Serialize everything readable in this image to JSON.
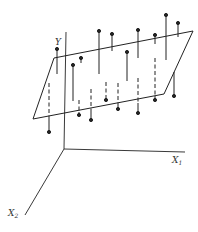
{
  "diagram": {
    "title": "",
    "stroke_color": "#222222",
    "axes": {
      "y_label": "Y",
      "x1_label": "X",
      "x1_sub": "1",
      "x2_label": "X",
      "x2_sub": "2",
      "origin": [
        64,
        149
      ],
      "y_end": [
        66,
        32
      ],
      "x1_end": [
        185,
        152
      ],
      "x2_end": [
        25,
        215
      ]
    },
    "plane": {
      "corners": [
        [
          54,
          58
        ],
        [
          193,
          31
        ],
        [
          164,
          94
        ],
        [
          33,
          119
        ]
      ]
    },
    "points_above": [
      {
        "x": 57,
        "top": 49,
        "bottom": 74
      },
      {
        "x": 81,
        "top": 58,
        "bottom": 63
      },
      {
        "x": 73,
        "top": 65,
        "bottom": 101
      },
      {
        "x": 99,
        "top": 31,
        "bottom": 74
      },
      {
        "x": 112,
        "top": 34,
        "bottom": 51
      },
      {
        "x": 127,
        "top": 52,
        "bottom": 81
      },
      {
        "x": 138,
        "top": 30,
        "bottom": 58
      },
      {
        "x": 155,
        "top": 35,
        "bottom": 44
      },
      {
        "x": 166,
        "top": 15,
        "bottom": 60
      },
      {
        "x": 178,
        "top": 23,
        "bottom": 37
      }
    ],
    "points_below": [
      {
        "x": 49,
        "dash_top": 83,
        "plane_y": 117,
        "dot": 132
      },
      {
        "x": 79,
        "dash_top": 100,
        "plane_y": 112,
        "dot": 115
      },
      {
        "x": 91,
        "dash_top": 89,
        "plane_y": 110,
        "dot": 120
      },
      {
        "x": 106,
        "dash_top": 82,
        "plane_y": 101,
        "dot": 100
      },
      {
        "x": 118,
        "dash_top": 83,
        "plane_y": 106,
        "dot": 109
      },
      {
        "x": 138,
        "dash_top": 78,
        "plane_y": 103,
        "dot": 113
      },
      {
        "x": 155,
        "dash_top": 58,
        "plane_y": 96,
        "dot": 100
      },
      {
        "x": 174,
        "dash_top": 72,
        "plane_y": 72,
        "dot": 96
      }
    ]
  }
}
